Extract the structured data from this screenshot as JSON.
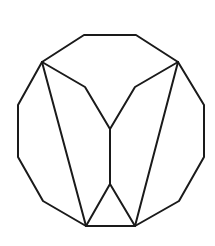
{
  "diagram": {
    "canvas": {
      "width": 215,
      "height": 246
    },
    "style": {
      "stroke_color": "#1a1a1a",
      "stroke_width": 2,
      "background": "#ffffff"
    },
    "outer_polygon": {
      "name": "dodecagon",
      "sides": 12,
      "vertices": [
        [
          84,
          35
        ],
        [
          136,
          35
        ],
        [
          178,
          62
        ],
        [
          204,
          105
        ],
        [
          204,
          157
        ],
        [
          179,
          201
        ],
        [
          135,
          226
        ],
        [
          86,
          226
        ],
        [
          43,
          201
        ],
        [
          18,
          157
        ],
        [
          18,
          105
        ],
        [
          42,
          62
        ]
      ]
    },
    "inner_segments": [
      {
        "name": "left-diagonal",
        "points": [
          [
            42,
            62
          ],
          [
            86,
            226
          ]
        ]
      },
      {
        "name": "right-diagonal",
        "points": [
          [
            178,
            62
          ],
          [
            135,
            226
          ]
        ]
      },
      {
        "name": "upper-w-path",
        "points": [
          [
            42,
            62
          ],
          [
            85,
            87
          ],
          [
            110,
            129
          ],
          [
            135,
            87
          ],
          [
            178,
            62
          ]
        ]
      },
      {
        "name": "center-stem",
        "points": [
          [
            110,
            129
          ],
          [
            110,
            184
          ]
        ]
      },
      {
        "name": "bottom-triangle-left",
        "points": [
          [
            110,
            184
          ],
          [
            86,
            226
          ]
        ]
      },
      {
        "name": "bottom-triangle-right",
        "points": [
          [
            110,
            184
          ],
          [
            135,
            226
          ]
        ]
      }
    ]
  }
}
